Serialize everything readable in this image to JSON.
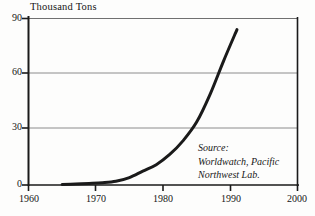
{
  "chart_data": {
    "type": "line",
    "title": "Thousand Tons",
    "xlabel": "",
    "ylabel": "Thousand Tons",
    "xlim": [
      1960,
      2000
    ],
    "ylim": [
      0,
      90
    ],
    "grid": true,
    "legend_position": "none",
    "x_ticks": [
      "1960",
      "1970",
      "1980",
      "1990",
      "2000"
    ],
    "y_ticks": [
      "0",
      "30",
      "60",
      "90"
    ],
    "x_tick_values": [
      1960,
      1970,
      1980,
      1990,
      2000
    ],
    "y_tick_values": [
      0,
      30,
      60,
      90
    ],
    "series": [
      {
        "name": "Production",
        "x": [
          1965,
          1967,
          1969,
          1971,
          1973,
          1975,
          1977,
          1979,
          1981,
          1983,
          1985,
          1987,
          1989,
          1991
        ],
        "values": [
          0.3,
          0.5,
          0.8,
          1.2,
          2.0,
          4.0,
          7.5,
          11.0,
          16.5,
          24.0,
          34.0,
          49.0,
          67.0,
          84.0
        ],
        "color": "#1a1a1a",
        "line_width": 3
      }
    ],
    "annotations": [
      {
        "name": "source-note",
        "lines": [
          "Source:",
          "Worldwatch, Pacific",
          "Northwest Lab."
        ]
      }
    ]
  },
  "axes": {
    "title": "Thousand Tons",
    "y_labels": [
      {
        "text": "90",
        "value": 90
      },
      {
        "text": "60",
        "value": 60
      },
      {
        "text": "30",
        "value": 30
      },
      {
        "text": "0",
        "value": 0
      }
    ],
    "x_labels": [
      {
        "text": "1960",
        "value": 1960
      },
      {
        "text": "1970",
        "value": 1970
      },
      {
        "text": "1980",
        "value": 1980
      },
      {
        "text": "1990",
        "value": 1990
      },
      {
        "text": "2000",
        "value": 2000
      }
    ]
  },
  "source": {
    "line1": "Source:",
    "line2": "Worldwatch, Pacific",
    "line3": "Northwest Lab."
  },
  "colors": {
    "curve": "#1a1a1a",
    "gridline": "#8c8c8c",
    "axis": "#1a1a1a",
    "background": "#fdfdfc"
  }
}
